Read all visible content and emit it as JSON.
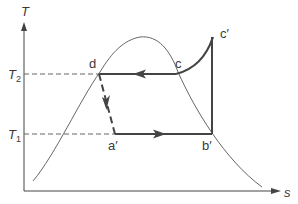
{
  "diagram": {
    "type": "T-s diagram (vapor-compression refrigeration cycle)",
    "axes": {
      "y_label": "T",
      "x_label": "s"
    },
    "temperature_levels": [
      {
        "id": "T2",
        "symbol": "T",
        "subscript": "2"
      },
      {
        "id": "T1",
        "symbol": "T",
        "subscript": "1"
      }
    ],
    "states": {
      "d": "d",
      "c": "c",
      "c_prime": "c′",
      "b_prime": "b′",
      "a_prime": "a′"
    },
    "processes": [
      {
        "from": "c′",
        "to": "c",
        "style": "solid-curve"
      },
      {
        "from": "c",
        "to": "d",
        "style": "solid-arrow",
        "direction": "left"
      },
      {
        "from": "d",
        "to": "a′",
        "style": "dashed-arrow",
        "direction": "down"
      },
      {
        "from": "a′",
        "to": "b′",
        "style": "solid-arrow",
        "direction": "right"
      },
      {
        "from": "b′",
        "to": "c′",
        "style": "solid-vertical"
      }
    ],
    "colors": {
      "line": "#444444",
      "dome": "#555555",
      "dash_guide": "#666666",
      "text": "#3a3a3a"
    }
  }
}
